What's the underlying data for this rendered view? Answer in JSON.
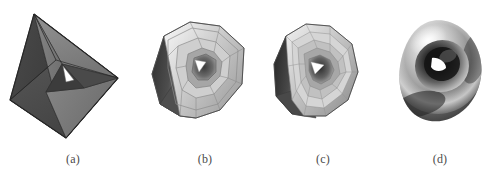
{
  "figure": {
    "background_color": "#ffffff",
    "width": 498,
    "height": 183,
    "panel_count": 4
  },
  "panels": [
    {
      "id": "a",
      "caption": "(a)",
      "shape_name": "control-mesh-tetrahedron",
      "description": "Coarse faceted tetrahedral control polyhedron with a triangular through-hole",
      "subdivision_level": 0,
      "colors": {
        "light_face": "#8e8e8e",
        "mid_face": "#7a7a7a",
        "dark_face": "#4e4e4e",
        "darkest_face": "#3a3a3a",
        "edge": "#2f2f2f",
        "hole": "#ffffff"
      }
    },
    {
      "id": "b",
      "caption": "(b)",
      "shape_name": "subdivided-mesh-level-1",
      "description": "Once-subdivided mesh, rounded silhouette with visible polygonal facets",
      "subdivision_level": 1,
      "colors": {
        "light_face": "#e2e2e2",
        "mid_face": "#a8a8a8",
        "dark_face": "#606060",
        "darkest_face": "#3d3d3d",
        "edge": "#555555",
        "hole": "#ffffff"
      }
    },
    {
      "id": "c",
      "caption": "(c)",
      "shape_name": "subdivided-mesh-level-2",
      "description": "Twice-subdivided mesh, nearly smooth with fine quad facets",
      "subdivision_level": 2,
      "colors": {
        "light_face": "#d9d9d9",
        "mid_face": "#9b9b9b",
        "dark_face": "#555555",
        "darkest_face": "#343434",
        "edge": "#6b6b6b",
        "hole": "#ffffff"
      }
    },
    {
      "id": "d",
      "caption": "(d)",
      "shape_name": "limit-smooth-surface",
      "description": "Smooth limit surface, rounded triangular torus with specular shading",
      "subdivision_level": "limit",
      "colors": {
        "highlight": "#f2f2f2",
        "mid_tone": "#9c9c9c",
        "shadow": "#2a2a2a",
        "deep_shadow": "#101010",
        "hole": "#ffffff"
      }
    }
  ]
}
